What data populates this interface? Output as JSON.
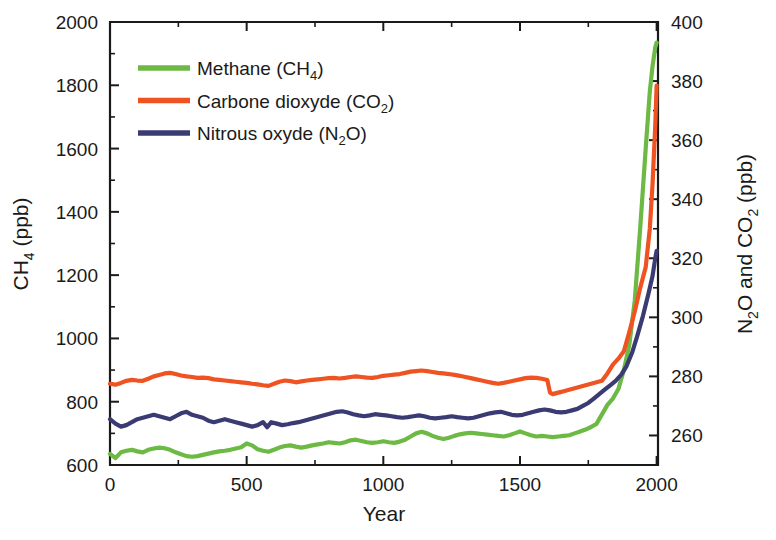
{
  "chart_data": {
    "type": "line",
    "title": "",
    "xlabel": "Year",
    "ylabel_left": "CH4 (ppb)",
    "ylabel_right": "N2O and CO2 (ppb)",
    "xlim": [
      0,
      2005
    ],
    "ylim_left": [
      600,
      2000
    ],
    "ylim_right": [
      250,
      400
    ],
    "grid": false,
    "legend_position": "top-left",
    "xticks": [
      0,
      500,
      1000,
      1500,
      2000
    ],
    "xtick_labels": [
      "0",
      "500",
      "1000",
      "1500",
      "2000"
    ],
    "xminor_step": 250,
    "yticks_left": [
      600,
      800,
      1000,
      1200,
      1400,
      1600,
      1800,
      2000
    ],
    "ytick_labels_left": [
      "600",
      "800",
      "1000",
      "1200",
      "1400",
      "1600",
      "1800",
      "2000"
    ],
    "yminor_step_left": 100,
    "yticks_right": [
      260,
      280,
      300,
      320,
      340,
      360,
      380,
      400
    ],
    "ytick_labels_right": [
      "260",
      "280",
      "300",
      "320",
      "340",
      "360",
      "380",
      "400"
    ],
    "yminor_step_right": 10,
    "series": [
      {
        "name": "Methane (CH4)",
        "legend_label": "Methane (CH",
        "legend_sub": "4",
        "legend_tail": ")",
        "color": "#6cb944",
        "axis": "left",
        "x": [
          0,
          20,
          40,
          60,
          80,
          100,
          120,
          140,
          160,
          180,
          200,
          220,
          240,
          260,
          280,
          300,
          320,
          340,
          360,
          380,
          400,
          420,
          440,
          460,
          480,
          500,
          520,
          540,
          560,
          580,
          600,
          620,
          640,
          660,
          680,
          700,
          720,
          740,
          760,
          780,
          800,
          820,
          840,
          860,
          880,
          900,
          920,
          940,
          960,
          980,
          1000,
          1020,
          1040,
          1060,
          1080,
          1100,
          1120,
          1140,
          1160,
          1180,
          1200,
          1220,
          1240,
          1260,
          1280,
          1300,
          1320,
          1340,
          1360,
          1380,
          1400,
          1420,
          1440,
          1460,
          1480,
          1500,
          1520,
          1540,
          1560,
          1580,
          1600,
          1620,
          1640,
          1660,
          1680,
          1700,
          1720,
          1740,
          1760,
          1780,
          1800,
          1820,
          1840,
          1860,
          1880,
          1900,
          1920,
          1940,
          1960,
          1975,
          1985,
          1995,
          2000
        ],
        "y": [
          635,
          622,
          640,
          645,
          648,
          643,
          640,
          648,
          652,
          655,
          653,
          648,
          640,
          634,
          628,
          626,
          628,
          632,
          636,
          640,
          643,
          645,
          648,
          652,
          656,
          668,
          662,
          650,
          645,
          642,
          648,
          655,
          660,
          662,
          658,
          655,
          658,
          662,
          665,
          668,
          672,
          670,
          668,
          672,
          678,
          680,
          676,
          672,
          670,
          672,
          675,
          672,
          670,
          674,
          680,
          690,
          700,
          705,
          700,
          692,
          686,
          682,
          686,
          692,
          697,
          700,
          702,
          700,
          698,
          696,
          694,
          692,
          690,
          694,
          700,
          706,
          700,
          694,
          690,
          692,
          690,
          688,
          690,
          692,
          694,
          700,
          706,
          712,
          720,
          730,
          760,
          790,
          810,
          840,
          900,
          980,
          1120,
          1350,
          1600,
          1780,
          1860,
          1920,
          1935
        ]
      },
      {
        "name": "Carbone dioxyde (CO2)",
        "legend_label": "Carbone dioxyde (CO",
        "legend_sub": "2",
        "legend_tail": ")",
        "color": "#ef5322",
        "axis": "right",
        "x": [
          0,
          20,
          40,
          60,
          80,
          100,
          120,
          140,
          160,
          180,
          200,
          220,
          240,
          260,
          280,
          300,
          320,
          340,
          360,
          380,
          400,
          420,
          440,
          460,
          480,
          500,
          520,
          540,
          560,
          580,
          600,
          620,
          640,
          660,
          680,
          700,
          720,
          740,
          760,
          780,
          800,
          820,
          840,
          860,
          880,
          900,
          920,
          940,
          960,
          980,
          1000,
          1020,
          1040,
          1060,
          1080,
          1100,
          1120,
          1140,
          1160,
          1180,
          1200,
          1220,
          1240,
          1260,
          1280,
          1300,
          1320,
          1340,
          1360,
          1380,
          1400,
          1420,
          1440,
          1460,
          1480,
          1500,
          1520,
          1540,
          1560,
          1580,
          1600,
          1610,
          1620,
          1640,
          1660,
          1680,
          1700,
          1720,
          1740,
          1760,
          1780,
          1800,
          1820,
          1840,
          1860,
          1880,
          1900,
          1920,
          1940,
          1960,
          1975,
          1985,
          1995,
          2000
        ],
        "y": [
          277.5,
          277.2,
          277.8,
          278.5,
          278.8,
          278.6,
          278.5,
          279.2,
          280.0,
          280.5,
          281.0,
          281.2,
          280.8,
          280.3,
          280.0,
          279.8,
          279.5,
          279.6,
          279.4,
          279.0,
          278.8,
          278.6,
          278.4,
          278.2,
          278.0,
          277.8,
          277.5,
          277.3,
          277.0,
          276.8,
          277.5,
          278.2,
          278.6,
          278.4,
          278.0,
          278.3,
          278.6,
          278.8,
          279.0,
          279.2,
          279.4,
          279.5,
          279.3,
          279.5,
          279.8,
          280.0,
          279.8,
          279.6,
          279.5,
          279.8,
          280.2,
          280.4,
          280.6,
          280.8,
          281.2,
          281.6,
          281.8,
          282.0,
          281.8,
          281.5,
          281.2,
          281.0,
          280.8,
          280.5,
          280.2,
          279.8,
          279.4,
          279.0,
          278.6,
          278.2,
          277.8,
          277.5,
          277.8,
          278.2,
          278.6,
          279.0,
          279.4,
          279.6,
          279.5,
          279.2,
          278.8,
          274.5,
          274.0,
          274.5,
          275.0,
          275.5,
          276.0,
          276.5,
          277.0,
          277.5,
          278.0,
          278.5,
          281.0,
          284.0,
          286.0,
          288.5,
          295.0,
          302.0,
          310.0,
          317.0,
          330.0,
          345.0,
          365.0,
          378.5
        ]
      },
      {
        "name": "Nitrous oxyde (N2O)",
        "legend_label": "Nitrous oxyde (N",
        "legend_sub": "2",
        "legend_tail": "O)",
        "color": "#3b3b73",
        "axis": "right",
        "x": [
          0,
          20,
          40,
          60,
          80,
          100,
          120,
          140,
          160,
          180,
          200,
          220,
          240,
          260,
          280,
          300,
          320,
          340,
          360,
          380,
          400,
          420,
          440,
          460,
          480,
          500,
          520,
          540,
          560,
          575,
          590,
          610,
          630,
          650,
          670,
          690,
          710,
          730,
          750,
          770,
          790,
          810,
          830,
          850,
          870,
          890,
          910,
          930,
          950,
          970,
          990,
          1010,
          1030,
          1050,
          1070,
          1090,
          1110,
          1130,
          1150,
          1170,
          1190,
          1210,
          1230,
          1250,
          1270,
          1290,
          1310,
          1330,
          1350,
          1370,
          1390,
          1410,
          1430,
          1450,
          1470,
          1490,
          1510,
          1530,
          1550,
          1570,
          1590,
          1610,
          1630,
          1650,
          1670,
          1690,
          1710,
          1730,
          1750,
          1770,
          1790,
          1810,
          1830,
          1850,
          1870,
          1890,
          1910,
          1930,
          1950,
          1970,
          1985,
          1995,
          2000
        ],
        "y": [
          265.5,
          264.0,
          263.0,
          263.5,
          264.5,
          265.5,
          266.0,
          266.5,
          267.0,
          266.5,
          266.0,
          265.5,
          266.5,
          267.5,
          268.0,
          267.0,
          266.5,
          266.0,
          265.0,
          264.5,
          265.0,
          265.5,
          265.0,
          264.5,
          264.0,
          263.5,
          263.0,
          263.5,
          264.5,
          262.8,
          264.5,
          264.0,
          263.5,
          263.8,
          264.2,
          264.5,
          265.0,
          265.5,
          266.0,
          266.5,
          267.0,
          267.5,
          268.0,
          268.2,
          267.8,
          267.2,
          266.8,
          266.5,
          266.8,
          267.2,
          267.0,
          266.8,
          266.5,
          266.2,
          266.0,
          266.2,
          266.5,
          266.8,
          266.5,
          266.0,
          265.8,
          266.0,
          266.2,
          266.5,
          266.2,
          266.0,
          265.8,
          266.0,
          266.5,
          267.0,
          267.5,
          267.8,
          268.0,
          267.5,
          267.0,
          266.8,
          267.0,
          267.5,
          268.0,
          268.5,
          268.8,
          268.5,
          268.0,
          267.8,
          268.0,
          268.5,
          269.0,
          270.0,
          271.0,
          272.5,
          274.0,
          275.5,
          277.0,
          278.5,
          280.5,
          283.5,
          288.0,
          294.0,
          300.5,
          308.0,
          314.0,
          320.0,
          322.5
        ]
      }
    ]
  },
  "legend": {
    "entries": [
      {
        "label_main": "Methane (CH",
        "sub": "4",
        "tail": ")",
        "color": "#6cb944"
      },
      {
        "label_main": "Carbone dioxyde (CO",
        "sub": "2",
        "tail": ")",
        "color": "#ef5322"
      },
      {
        "label_main": "Nitrous oxyde (N",
        "sub": "2",
        "tail": "O)",
        "color": "#3b3b73"
      }
    ]
  },
  "axes": {
    "x_title": "Year",
    "y_left_main": "CH",
    "y_left_sub": "4",
    "y_left_tail": " (ppb)",
    "y_right_part1": "N",
    "y_right_sub1": "2",
    "y_right_part2": "O and CO",
    "y_right_sub2": "2",
    "y_right_tail": " (ppb)"
  }
}
